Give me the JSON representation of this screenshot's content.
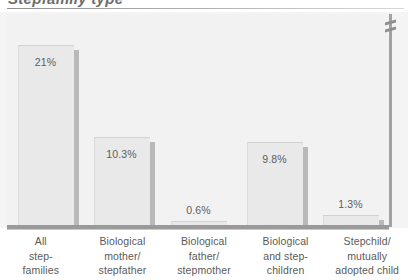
{
  "title": {
    "text": "Stepfamily type",
    "note": "clipped-at-top"
  },
  "chart_data": {
    "type": "bar",
    "title": "Stepfamily type",
    "xlabel": "",
    "ylabel": "",
    "grid": false,
    "legend": "none",
    "ylim": [
      0,
      22
    ],
    "axis_break_right": true,
    "categories": [
      "All step-families",
      "Biological mother/ stepfather",
      "Biological father/ stepmother",
      "Biological and step-children",
      "Stepchild/ mutually adopted child"
    ],
    "category_lines": [
      [
        "All",
        "step-",
        "families"
      ],
      [
        "Biological",
        "mother/",
        "stepfather"
      ],
      [
        "Biological",
        "father/",
        "stepmother"
      ],
      [
        "Biological",
        "and step-",
        "children"
      ],
      [
        "Stepchild/",
        "mutually",
        "adopted child"
      ]
    ],
    "values": [
      21,
      10.3,
      0.6,
      9.8,
      1.3
    ],
    "value_labels": [
      "21%",
      "10.3%",
      "0.6%",
      "9.8%",
      "1.3%"
    ]
  },
  "style": {
    "bar_fill": "#e9e9e9",
    "bar_shadow": "#b9b9b9",
    "plot_background": "#f2f2f2",
    "axis_color": "#9a9a9a",
    "text_color": "#5a5a5a"
  }
}
